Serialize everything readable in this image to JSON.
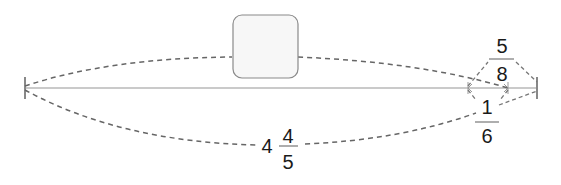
{
  "diagram": {
    "type": "number-line-with-brackets",
    "colors": {
      "line": "#b8b8b8",
      "tick": "#888888",
      "dash": "#666666",
      "box_fill": "#f7f7f7",
      "box_stroke": "#8a8a8a",
      "text": "#1a1a1a"
    },
    "unknown_box": {
      "label": ""
    },
    "segments": [
      {
        "id": "total_bottom",
        "whole": "4",
        "numerator": "4",
        "denominator": "5"
      },
      {
        "id": "top_right",
        "whole": "",
        "numerator": "5",
        "denominator": "8"
      },
      {
        "id": "bottom_right",
        "whole": "",
        "numerator": "1",
        "denominator": "6"
      }
    ]
  }
}
